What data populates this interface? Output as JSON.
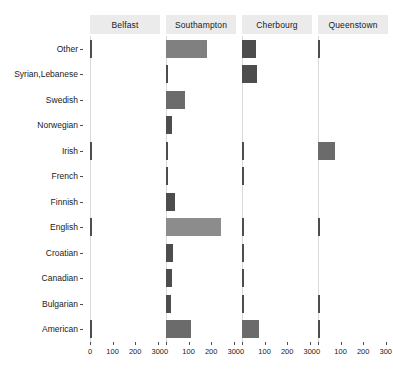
{
  "chart_data": {
    "type": "bar",
    "orientation": "horizontal",
    "title": "",
    "subtitle": "",
    "xlabel": "",
    "ylabel": "",
    "xlim": [
      0,
      310
    ],
    "ylim": null,
    "grid": false,
    "legend": "none",
    "facet_by": "embarkation_port",
    "facet_layout": "1x4",
    "xticks": [
      0,
      100,
      200,
      300
    ],
    "xticklabels": [
      "0",
      "100",
      "200",
      "300"
    ],
    "categories": [
      "Other",
      "Syrian,Lebanese",
      "Swedish",
      "Norwegian",
      "Irish",
      "French",
      "Finnish",
      "English",
      "Croatian",
      "Canadian",
      "Bulgarian",
      "American"
    ],
    "facets": [
      "Belfast",
      "Southampton",
      "Cherbourg",
      "Queenstown"
    ],
    "series": [
      {
        "name": "Belfast",
        "values": [
          3,
          0,
          0,
          0,
          4,
          0,
          0,
          3,
          0,
          0,
          0,
          3
        ]
      },
      {
        "name": "Southampton",
        "values": [
          180,
          3,
          85,
          25,
          3,
          3,
          42,
          245,
          30,
          27,
          22,
          110
        ]
      },
      {
        "name": "Cherbourg",
        "values": [
          62,
          66,
          0,
          0,
          3,
          5,
          0,
          3,
          3,
          3,
          2,
          74
        ]
      },
      {
        "name": "Queenstown",
        "values": [
          3,
          0,
          0,
          0,
          74,
          0,
          0,
          3,
          0,
          0,
          3,
          3
        ]
      }
    ],
    "fill_scale": "greyscale-by-value",
    "colors": {
      "bar_dark": "#4d4d4d",
      "bar_mid": "#6b6b6b",
      "bar_light": "#808080",
      "bar_lighter": "#8c8c8c",
      "strip_background": "#ebebeb",
      "axis_line": "#d9d9d9",
      "tick": "#4d4d4d",
      "text": "#1a1a1a",
      "panel_background": "#ffffff"
    }
  }
}
